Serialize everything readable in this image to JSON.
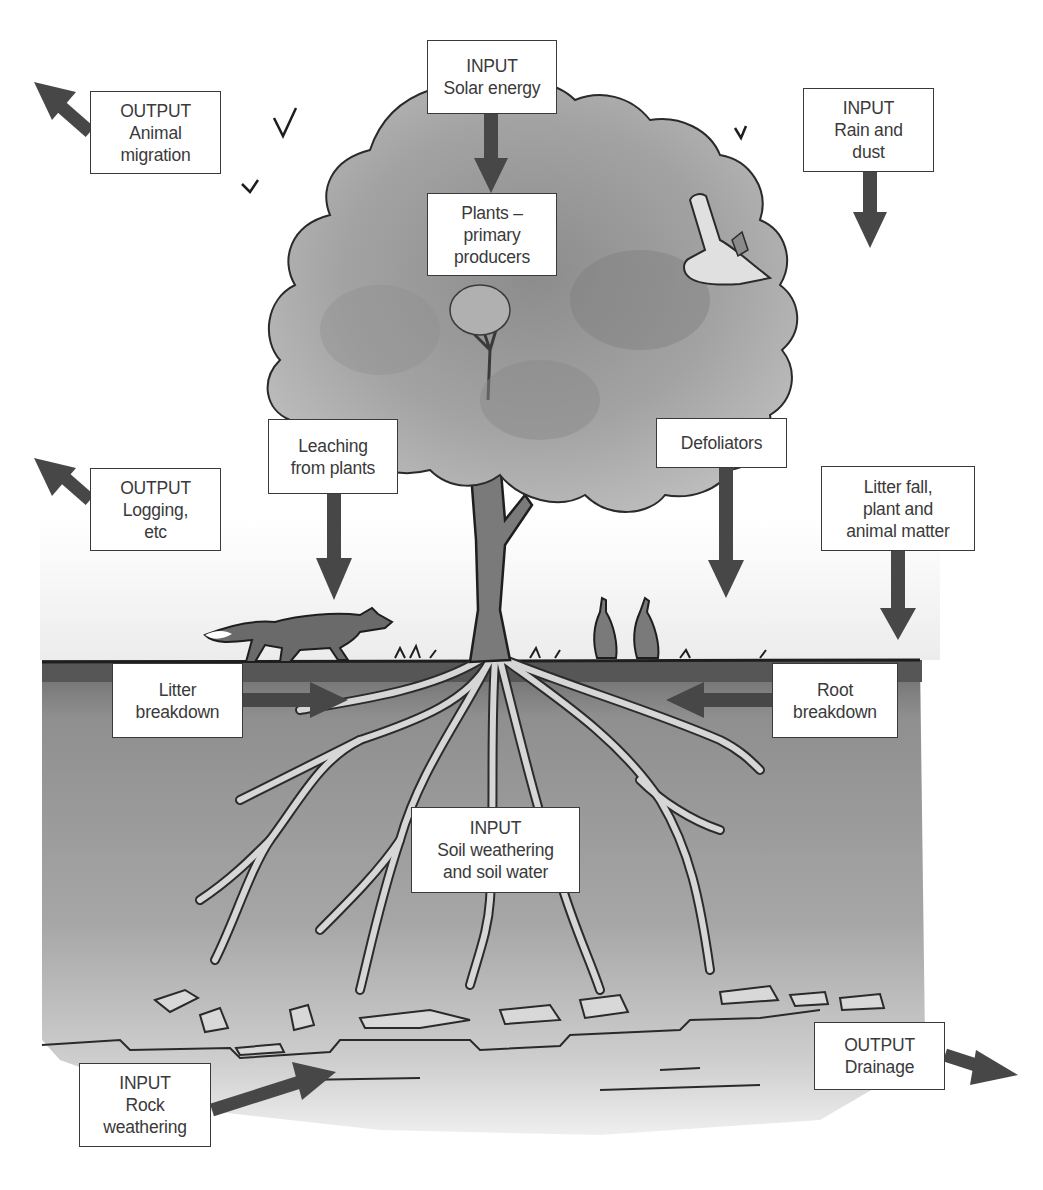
{
  "diagram": {
    "type": "ecosystem nutrient cycle illustration",
    "colors": {
      "arrow": "#474747",
      "box_border": "#3a3a3a",
      "text": "#3a3a3a",
      "canopy": "#9a9a9a",
      "soil": "#8a8a8a",
      "topsoil": "#5e5e5e"
    },
    "labels": {
      "output_migration": {
        "lines": [
          "OUTPUT",
          "Animal",
          "migration"
        ],
        "arrow_direction": "up-left"
      },
      "input_solar": {
        "lines": [
          "INPUT",
          "Solar energy"
        ],
        "arrow_direction": "down"
      },
      "plants_producers": {
        "lines": [
          "Plants –",
          "primary",
          "producers"
        ]
      },
      "input_rain": {
        "lines": [
          "INPUT",
          "Rain and",
          "dust"
        ],
        "arrow_direction": "down"
      },
      "output_logging": {
        "lines": [
          "OUTPUT",
          "Logging,",
          "etc"
        ],
        "arrow_direction": "up-left"
      },
      "leaching": {
        "lines": [
          "Leaching",
          "from plants"
        ],
        "arrow_direction": "down"
      },
      "defoliators": {
        "lines": [
          "Defoliators"
        ],
        "arrow_direction": "down"
      },
      "litter_fall": {
        "lines": [
          "Litter fall,",
          "plant and",
          "animal matter"
        ],
        "arrow_direction": "down"
      },
      "litter_breakdown": {
        "lines": [
          "Litter",
          "breakdown"
        ],
        "arrow_direction": "right"
      },
      "root_breakdown": {
        "lines": [
          "Root",
          "breakdown"
        ],
        "arrow_direction": "left"
      },
      "input_soil": {
        "lines": [
          "INPUT",
          "Soil weathering",
          "and soil water"
        ]
      },
      "input_rock": {
        "lines": [
          "INPUT",
          "Rock",
          "weathering"
        ],
        "arrow_direction": "up-right"
      },
      "output_drainage": {
        "lines": [
          "OUTPUT",
          "Drainage"
        ],
        "arrow_direction": "down-right"
      }
    },
    "illustrations": [
      "tree-canopy",
      "tree-trunk",
      "roots",
      "fox",
      "rabbits",
      "owl",
      "birds",
      "rocks",
      "bedrock"
    ]
  }
}
